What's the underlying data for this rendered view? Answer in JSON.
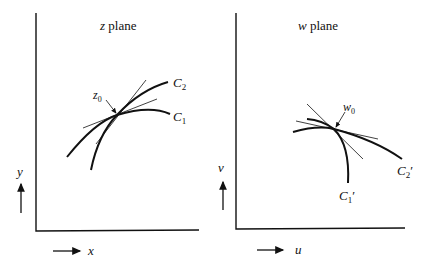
{
  "figure": {
    "left_panel": {
      "title_var": "z",
      "title_word": " plane",
      "point_label": "z",
      "point_sub": "0",
      "curve1_label": "C",
      "curve1_sub": "1",
      "curve2_label": "C",
      "curve2_sub": "2",
      "x_axis_label": "x",
      "y_axis_label": "y"
    },
    "right_panel": {
      "title_var": "w",
      "title_word": " plane",
      "point_label": "w",
      "point_sub": "0",
      "curve1_label": "C",
      "curve1_sub": "1",
      "curve1_prime": "′",
      "curve2_label": "C",
      "curve2_sub": "2",
      "curve2_prime": "′",
      "x_axis_label": "u",
      "y_axis_label": "v"
    },
    "colors": {
      "ink": "#111111",
      "background": "#ffffff"
    }
  }
}
